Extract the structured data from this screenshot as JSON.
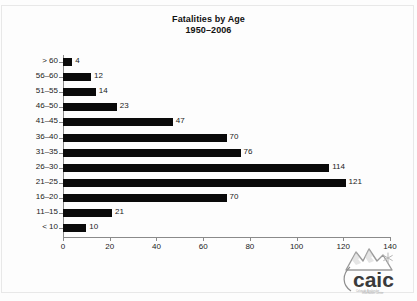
{
  "chart_data": {
    "type": "bar",
    "orientation": "horizontal",
    "title": "Fatalities by Age",
    "subtitle": "1950–2006",
    "xlabel": "",
    "ylabel": "",
    "xlim": [
      0,
      140
    ],
    "ylim": null,
    "grid": false,
    "legend": null,
    "xticks": [
      0,
      20,
      40,
      60,
      80,
      100,
      120,
      140
    ],
    "xtick_labels": [
      "0",
      "20",
      "40",
      "60",
      "80",
      "100",
      "120",
      "140"
    ],
    "categories": [
      "> 60",
      "56–60",
      "51–55",
      "46–50",
      "41–45",
      "36–40",
      "31–35",
      "26–30",
      "21–25",
      "16–20",
      "11–15",
      "< 10"
    ],
    "values": [
      4,
      12,
      14,
      23,
      47,
      70,
      76,
      114,
      121,
      70,
      21,
      10
    ],
    "value_labels": [
      "4",
      "12",
      "14",
      "23",
      "47",
      "70",
      "76",
      "114",
      "121",
      "70",
      "21",
      "10"
    ],
    "bar_color": "#0a0a0a",
    "axis_color": "#8a8a8a",
    "background": "#fdfdfd"
  },
  "logo": {
    "wordmark": "caic",
    "tagline": "Colorado Avalanche Information Center",
    "mountain_icon": "mountain-peaks-icon",
    "snowflake_icon": "snowflake-icon"
  }
}
